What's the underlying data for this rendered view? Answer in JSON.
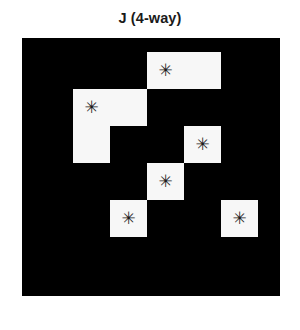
{
  "figure": {
    "title": "J (4-way)",
    "background_color": "#ffffff",
    "panel_color": "#000000",
    "cell_color": "#f7f7f7",
    "marker_color": "#1c1c1c",
    "marker_glyph": "✳"
  },
  "chart_data": {
    "type": "heatmap",
    "title": "J (4-way)",
    "subtitle": "",
    "xlabel": "",
    "ylabel": "",
    "grid_columns": 7,
    "grid_rows": 7,
    "grid": [
      [
        0,
        0,
        0,
        1,
        1,
        0,
        0
      ],
      [
        0,
        1,
        1,
        0,
        0,
        0,
        0
      ],
      [
        0,
        1,
        0,
        0,
        1,
        0,
        0
      ],
      [
        0,
        0,
        0,
        1,
        0,
        0,
        0
      ],
      [
        0,
        0,
        1,
        0,
        0,
        1,
        0
      ],
      [
        0,
        0,
        0,
        0,
        0,
        0,
        0
      ],
      [
        0,
        0,
        0,
        0,
        0,
        0,
        0
      ]
    ],
    "legend": [],
    "annotations": [
      {
        "label": "marker",
        "glyph": "✳",
        "col": 3,
        "row": 0
      },
      {
        "label": "marker",
        "glyph": "✳",
        "col": 1,
        "row": 1
      },
      {
        "label": "marker",
        "glyph": "✳",
        "col": 4,
        "row": 2
      },
      {
        "label": "marker",
        "glyph": "✳",
        "col": 3,
        "row": 3
      },
      {
        "label": "marker",
        "glyph": "✳",
        "col": 2,
        "row": 4
      },
      {
        "label": "marker",
        "glyph": "✳",
        "col": 5,
        "row": 4
      }
    ],
    "cells": [
      {
        "name": "cell-top-pair-left",
        "col": 3,
        "row": 0,
        "col_span": 1,
        "row_span": 1,
        "marker": false
      },
      {
        "name": "cell-top-pair-right",
        "col": 4,
        "row": 0,
        "col_span": 1,
        "row_span": 1,
        "marker": false
      },
      {
        "name": "cell-left-upper-a",
        "col": 1,
        "row": 1,
        "col_span": 1,
        "row_span": 1,
        "marker": false
      },
      {
        "name": "cell-left-upper-b",
        "col": 2,
        "row": 1,
        "col_span": 1,
        "row_span": 1,
        "marker": false
      },
      {
        "name": "cell-left-lower",
        "col": 1,
        "row": 2,
        "col_span": 1,
        "row_span": 1,
        "marker": false
      },
      {
        "name": "cell-mid-right",
        "col": 4,
        "row": 2,
        "col_span": 1,
        "row_span": 1,
        "marker": false
      },
      {
        "name": "cell-center",
        "col": 3,
        "row": 3,
        "col_span": 1,
        "row_span": 1,
        "marker": false
      },
      {
        "name": "cell-bottom-left",
        "col": 2,
        "row": 4,
        "col_span": 1,
        "row_span": 1,
        "marker": false
      },
      {
        "name": "cell-bottom-right",
        "col": 5,
        "row": 4,
        "col_span": 1,
        "row_span": 1,
        "marker": false
      }
    ],
    "grid_on": false,
    "axis_visible": false,
    "cell_size_px": 37,
    "origin_offset_px": {
      "x": 14,
      "y": 14
    }
  }
}
